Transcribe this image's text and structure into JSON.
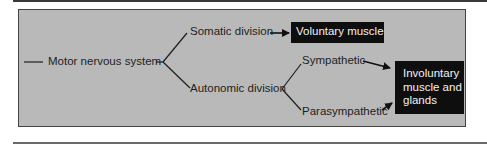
{
  "diagram": {
    "root": {
      "label": "Motor nervous system"
    },
    "divisions": [
      {
        "label": "Somatic division",
        "target": "Voluntary muscle"
      },
      {
        "label": "Autonomic division",
        "subdivisions": [
          {
            "label": "Sympathetic"
          },
          {
            "label": "Parasympathetic"
          }
        ],
        "target": "Involuntary muscle and glands"
      }
    ],
    "targets": {
      "voluntary": "Voluntary muscle",
      "involuntary_line1": "Involuntary",
      "involuntary_line2": "muscle and",
      "involuntary_line3": "glands"
    }
  },
  "colors": {
    "panel": "#b9b9b9",
    "box": "#0e0e0e",
    "box_text": "#f2f2f2",
    "line": "#1e1e1e"
  }
}
